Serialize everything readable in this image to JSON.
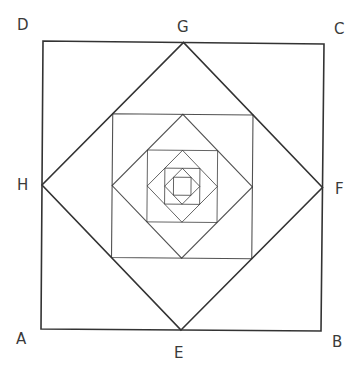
{
  "diagram": {
    "labels": {
      "A": "A",
      "B": "B",
      "C": "C",
      "D": "D",
      "E": "E",
      "F": "F",
      "G": "G",
      "H": "H"
    },
    "nesting_levels": 9,
    "stroke_color": "#333333"
  }
}
